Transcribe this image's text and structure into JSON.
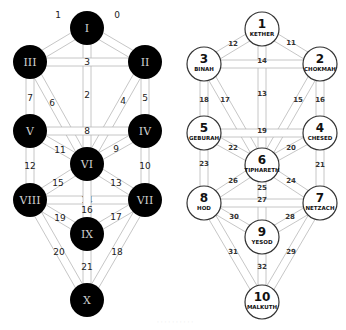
{
  "diagram": {
    "colors": {
      "dark_node": "#000000",
      "light_node": "#ffffff",
      "path_stroke": "#b8b8b8",
      "numeral": "#d0d0d0"
    },
    "left_tree": {
      "node_style": "dark",
      "node_radius": 17,
      "nodes": [
        {
          "id": "I",
          "label": "I",
          "x": 87,
          "y": 28
        },
        {
          "id": "II",
          "label": "II",
          "x": 145,
          "y": 62
        },
        {
          "id": "III",
          "label": "III",
          "x": 30,
          "y": 62
        },
        {
          "id": "IV",
          "label": "IV",
          "x": 145,
          "y": 131
        },
        {
          "id": "V",
          "label": "V",
          "x": 30,
          "y": 131
        },
        {
          "id": "VI",
          "label": "VI",
          "x": 87,
          "y": 164
        },
        {
          "id": "VII",
          "label": "VII",
          "x": 145,
          "y": 200
        },
        {
          "id": "VIII",
          "label": "VIII",
          "x": 30,
          "y": 200
        },
        {
          "id": "IX",
          "label": "IX",
          "x": 87,
          "y": 234
        },
        {
          "id": "X",
          "label": "X",
          "x": 87,
          "y": 300
        }
      ],
      "paths": [
        {
          "label": "0",
          "from": "I",
          "to": "II",
          "lx": 117,
          "ly": 15
        },
        {
          "label": "1",
          "from": "I",
          "to": "III",
          "lx": 58,
          "ly": 15
        },
        {
          "label": "2",
          "from": "I",
          "to": "VI",
          "lx": 87,
          "ly": 95
        },
        {
          "label": "3",
          "from": "III",
          "to": "II",
          "lx": 87,
          "ly": 62
        },
        {
          "label": "4",
          "from": "II",
          "to": "VI",
          "lx": 123,
          "ly": 101
        },
        {
          "label": "5",
          "from": "II",
          "to": "IV",
          "lx": 145,
          "ly": 98
        },
        {
          "label": "6",
          "from": "III",
          "to": "VI",
          "lx": 52,
          "ly": 103
        },
        {
          "label": "7",
          "from": "III",
          "to": "V",
          "lx": 30,
          "ly": 98
        },
        {
          "label": "8",
          "from": "V",
          "to": "IV",
          "lx": 87,
          "ly": 131
        },
        {
          "label": "9",
          "from": "IV",
          "to": "VI",
          "lx": 116,
          "ly": 149
        },
        {
          "label": "10",
          "from": "IV",
          "to": "VII",
          "lx": 145,
          "ly": 166
        },
        {
          "label": "11",
          "from": "V",
          "to": "VI",
          "lx": 60,
          "ly": 150
        },
        {
          "label": "12",
          "from": "V",
          "to": "VIII",
          "lx": 30,
          "ly": 166
        },
        {
          "label": "13",
          "from": "VI",
          "to": "VII",
          "lx": 116,
          "ly": 183
        },
        {
          "label": "14",
          "from": "VIII",
          "to": "VII",
          "lx": 87,
          "ly": 200
        },
        {
          "label": "15",
          "from": "VI",
          "to": "VIII",
          "lx": 58,
          "ly": 183
        },
        {
          "label": "16",
          "from": "VI",
          "to": "IX",
          "lx": 87,
          "ly": 210
        },
        {
          "label": "17",
          "from": "VII",
          "to": "IX",
          "lx": 116,
          "ly": 217
        },
        {
          "label": "18",
          "from": "VII",
          "to": "X",
          "lx": 117,
          "ly": 252
        },
        {
          "label": "19",
          "from": "VIII",
          "to": "IX",
          "lx": 60,
          "ly": 218
        },
        {
          "label": "20",
          "from": "VIII",
          "to": "X",
          "lx": 59,
          "ly": 252
        },
        {
          "label": "21",
          "from": "IX",
          "to": "X",
          "lx": 87,
          "ly": 267
        }
      ]
    },
    "right_tree": {
      "node_style": "light",
      "node_radius": 17,
      "nodes": [
        {
          "id": "1",
          "number": "1",
          "name": "KETHER",
          "x": 262,
          "y": 29
        },
        {
          "id": "2",
          "number": "2",
          "name": "CHOKMAH",
          "x": 320,
          "y": 64
        },
        {
          "id": "3",
          "number": "3",
          "name": "BINAH",
          "x": 204,
          "y": 64
        },
        {
          "id": "4",
          "number": "4",
          "name": "CHESED",
          "x": 320,
          "y": 133
        },
        {
          "id": "5",
          "number": "5",
          "name": "GEBURAH",
          "x": 204,
          "y": 133
        },
        {
          "id": "6",
          "number": "6",
          "name": "TIPHARETH",
          "x": 262,
          "y": 165
        },
        {
          "id": "7",
          "number": "7",
          "name": "NETZACH",
          "x": 320,
          "y": 203
        },
        {
          "id": "8",
          "number": "8",
          "name": "HOD",
          "x": 204,
          "y": 203
        },
        {
          "id": "9",
          "number": "9",
          "name": "YESOD",
          "x": 262,
          "y": 237
        },
        {
          "id": "10",
          "number": "10",
          "name": "MALKUTH",
          "x": 262,
          "y": 302
        }
      ],
      "paths": [
        {
          "label": "11",
          "from": "1",
          "to": "2",
          "lx": 291,
          "ly": 43
        },
        {
          "label": "12",
          "from": "1",
          "to": "3",
          "lx": 233,
          "ly": 44
        },
        {
          "label": "13",
          "from": "1",
          "to": "6",
          "lx": 262,
          "ly": 94
        },
        {
          "label": "14",
          "from": "3",
          "to": "2",
          "lx": 262,
          "ly": 61
        },
        {
          "label": "15",
          "from": "2",
          "to": "6",
          "lx": 298,
          "ly": 100
        },
        {
          "label": "16",
          "from": "2",
          "to": "4",
          "lx": 320,
          "ly": 100
        },
        {
          "label": "17",
          "from": "3",
          "to": "6",
          "lx": 225,
          "ly": 100
        },
        {
          "label": "18",
          "from": "3",
          "to": "5",
          "lx": 204,
          "ly": 100
        },
        {
          "label": "19",
          "from": "5",
          "to": "4",
          "lx": 262,
          "ly": 131
        },
        {
          "label": "20",
          "from": "4",
          "to": "6",
          "lx": 291,
          "ly": 148
        },
        {
          "label": "21",
          "from": "4",
          "to": "7",
          "lx": 320,
          "ly": 165
        },
        {
          "label": "22",
          "from": "5",
          "to": "6",
          "lx": 233,
          "ly": 148
        },
        {
          "label": "23",
          "from": "5",
          "to": "8",
          "lx": 204,
          "ly": 164
        },
        {
          "label": "24",
          "from": "6",
          "to": "7",
          "lx": 291,
          "ly": 181
        },
        {
          "label": "25",
          "from": "6",
          "to": "9",
          "lx": 262,
          "ly": 188
        },
        {
          "label": "26",
          "from": "6",
          "to": "8",
          "lx": 233,
          "ly": 181
        },
        {
          "label": "27",
          "from": "8",
          "to": "7",
          "lx": 262,
          "ly": 200
        },
        {
          "label": "28",
          "from": "7",
          "to": "9",
          "lx": 290,
          "ly": 217
        },
        {
          "label": "29",
          "from": "7",
          "to": "10",
          "lx": 291,
          "ly": 252
        },
        {
          "label": "30",
          "from": "8",
          "to": "9",
          "lx": 234,
          "ly": 217
        },
        {
          "label": "31",
          "from": "8",
          "to": "10",
          "lx": 233,
          "ly": 252
        },
        {
          "label": "32",
          "from": "9",
          "to": "10",
          "lx": 262,
          "ly": 267
        }
      ]
    },
    "caption": {
      "text": "· · · · · · · · · ·",
      "x": 175,
      "y": 324
    }
  }
}
